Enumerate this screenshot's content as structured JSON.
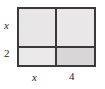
{
  "figure": {
    "type": "area-model-diagram",
    "border_color": "#3a3a3a",
    "fill_color": "#e8e6e6",
    "shaded_cell_color": "#d8d6d6"
  },
  "labels": {
    "left_top": "x",
    "left_bottom": "2",
    "bottom_left": "x",
    "bottom_right": "4"
  },
  "chart_data": {
    "type": "table",
    "title": "",
    "xlabel": "",
    "ylabel": "",
    "columns": [
      "x",
      "4"
    ],
    "rows": [
      "x",
      "2"
    ],
    "cells": [
      [
        {
          "row": "x",
          "col": "x",
          "shaded": false
        },
        {
          "row": "x",
          "col": "4",
          "shaded": false
        }
      ],
      [
        {
          "row": "2",
          "col": "x",
          "shaded": false
        },
        {
          "row": "2",
          "col": "4",
          "shaded": true
        }
      ]
    ],
    "column_widths": [
      36,
      37
    ],
    "row_heights": [
      37,
      17
    ]
  }
}
